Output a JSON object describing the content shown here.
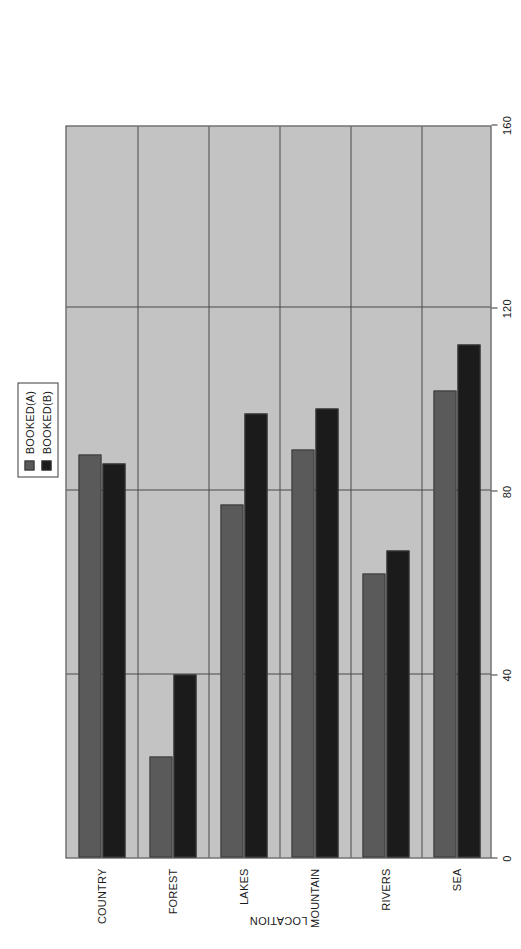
{
  "chart_data": {
    "type": "bar",
    "orientation": "horizontal",
    "title": "",
    "subtitle": "",
    "xlabel": "BOOKINGS",
    "ylabel": "LOCATION",
    "categories": [
      "COUNTRY",
      "FOREST",
      "LAKES",
      "MOUNTAIN",
      "RIVERS",
      "SEA"
    ],
    "series": [
      {
        "name": "BOOKED(A)",
        "color": "#5a5a5a",
        "values": [
          88,
          22,
          77,
          89,
          62,
          102
        ]
      },
      {
        "name": "BOOKED(B)",
        "color": "#1b1b1b",
        "values": [
          86,
          40,
          97,
          98,
          67,
          112
        ]
      }
    ],
    "xlim": [
      0,
      160
    ],
    "xticks": [
      0,
      40,
      80,
      120,
      160
    ],
    "xtick_labels": [
      "0",
      "40",
      "80",
      "120",
      "160"
    ],
    "grid": true,
    "grid_axis": "value",
    "legend_position": "outside-upper",
    "plot_background": "#c3c3c3",
    "figure_background": "#ffffff",
    "axis_color": "#4a4a4a"
  },
  "legend": {
    "entries": [
      {
        "label": "BOOKED(A)",
        "swatch": "#5a5a5a"
      },
      {
        "label": "BOOKED(B)",
        "swatch": "#1b1b1b"
      }
    ]
  },
  "axes": {
    "value_axis_title": "BOOKINGS",
    "category_axis_title": "LOCATION"
  }
}
